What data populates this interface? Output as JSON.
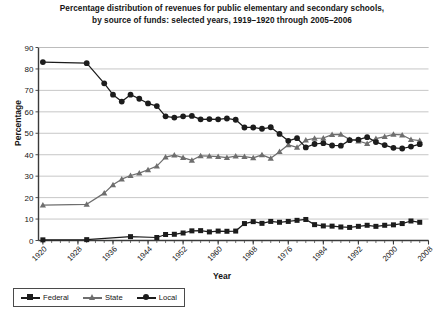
{
  "chart_data": {
    "type": "line",
    "title": "Percentage distribution of revenues for public elementary and secondary schools, by source of funds: selected years, 1919–1920 through 2005–2006",
    "title_lines": [
      "Percentage distribution of revenues for public elementary and secondary schools,",
      "by source of funds: selected years, 1919–1920 through 2005–2006"
    ],
    "xlabel": "Year",
    "ylabel": "Percentage",
    "ylim": [
      0,
      90
    ],
    "xlim": [
      1919,
      2008
    ],
    "yticks": [
      0,
      10,
      20,
      30,
      40,
      50,
      60,
      70,
      80,
      90
    ],
    "xticks": [
      1920,
      1928,
      1936,
      1944,
      1952,
      1960,
      1968,
      1976,
      1984,
      1992,
      2000,
      2008
    ],
    "xtick_labels": [
      "1920",
      "1928",
      "1936",
      "1944",
      "1952",
      "1960",
      "1968",
      "1976",
      "1984",
      "1992",
      "2000",
      "2008"
    ],
    "minor_tick_step": 2,
    "grid": "horizontal",
    "legend_position": "below-left",
    "series": [
      {
        "name": "Federal",
        "marker": "square",
        "color": "#1c1c1c",
        "x": [
          1920,
          1930,
          1940,
          1946,
          1948,
          1950,
          1952,
          1954,
          1956,
          1958,
          1960,
          1962,
          1964,
          1966,
          1968,
          1970,
          1972,
          1974,
          1976,
          1978,
          1980,
          1982,
          1984,
          1986,
          1988,
          1990,
          1992,
          1994,
          1996,
          1998,
          2000,
          2002,
          2004,
          2006
        ],
        "values": [
          0.3,
          0.4,
          1.8,
          1.4,
          2.8,
          2.9,
          3.5,
          4.5,
          4.6,
          4.0,
          4.4,
          4.3,
          4.4,
          7.9,
          8.8,
          8.0,
          8.9,
          8.5,
          8.9,
          9.4,
          9.8,
          7.4,
          6.8,
          6.7,
          6.3,
          6.1,
          6.6,
          7.1,
          6.6,
          7.1,
          7.3,
          7.9,
          9.1,
          8.5
        ]
      },
      {
        "name": "State",
        "marker": "triangle",
        "color": "#6e6e6e",
        "x": [
          1920,
          1930,
          1934,
          1936,
          1938,
          1940,
          1942,
          1944,
          1946,
          1948,
          1950,
          1952,
          1954,
          1956,
          1958,
          1960,
          1962,
          1964,
          1966,
          1968,
          1970,
          1972,
          1974,
          1976,
          1978,
          1980,
          1982,
          1984,
          1986,
          1988,
          1990,
          1992,
          1994,
          1996,
          1998,
          2000,
          2002,
          2004,
          2006
        ],
        "values": [
          16.5,
          16.9,
          22.1,
          26.0,
          28.6,
          30.3,
          31.4,
          33.0,
          34.7,
          38.9,
          39.8,
          38.6,
          37.4,
          39.5,
          39.4,
          39.1,
          38.7,
          39.3,
          39.1,
          38.5,
          39.9,
          38.3,
          41.4,
          44.6,
          43.4,
          46.8,
          47.6,
          47.8,
          49.4,
          49.5,
          47.1,
          46.4,
          45.2,
          47.5,
          48.4,
          49.5,
          49.2,
          47.1,
          46.6
        ]
      },
      {
        "name": "Local",
        "marker": "circle",
        "color": "#1c1c1c",
        "x": [
          1920,
          1930,
          1934,
          1936,
          1938,
          1940,
          1942,
          1944,
          1946,
          1948,
          1950,
          1952,
          1954,
          1956,
          1958,
          1960,
          1962,
          1964,
          1966,
          1968,
          1970,
          1972,
          1974,
          1976,
          1978,
          1980,
          1982,
          1984,
          1986,
          1988,
          1990,
          1992,
          1994,
          1996,
          1998,
          2000,
          2002,
          2004,
          2006
        ],
        "values": [
          83.2,
          82.7,
          73.3,
          68.0,
          64.8,
          68.0,
          66.1,
          63.9,
          62.7,
          57.9,
          57.3,
          57.9,
          58.1,
          56.5,
          56.6,
          56.5,
          56.9,
          56.3,
          52.7,
          52.7,
          52.1,
          52.8,
          49.7,
          46.5,
          47.7,
          43.4,
          45.0,
          45.4,
          44.3,
          44.2,
          46.8,
          47.0,
          48.2,
          45.9,
          44.5,
          43.2,
          42.9,
          43.8,
          44.9
        ]
      }
    ]
  },
  "legend": {
    "items": [
      {
        "label": "Federal",
        "marker": "square"
      },
      {
        "label": "State",
        "marker": "triangle"
      },
      {
        "label": "Local",
        "marker": "circle"
      }
    ]
  },
  "colors": {
    "federal": "#1c1c1c",
    "state": "#6e6e6e",
    "local": "#1c1c1c",
    "grid": "#b9b9b9",
    "axis": "#3a3a3a",
    "text": "#151515"
  }
}
